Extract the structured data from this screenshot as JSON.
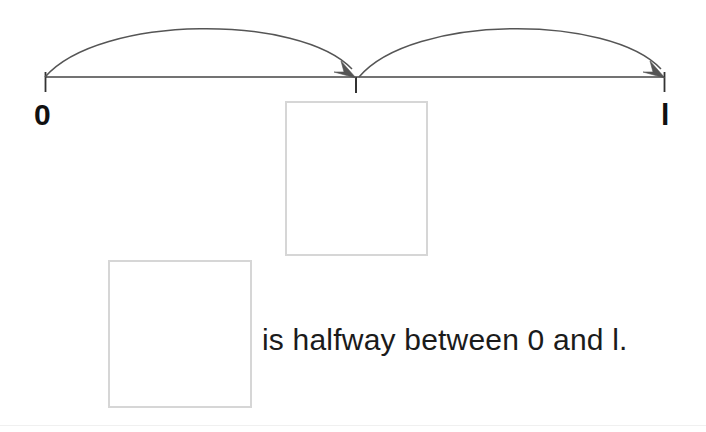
{
  "canvas": {
    "width": 706,
    "height": 432,
    "background": "#ffffff"
  },
  "diagram": {
    "type": "number-line-with-hop-arcs",
    "line": {
      "color": "#444444",
      "stroke_width": 1.6,
      "start_x": 45,
      "end_x": 665,
      "y": 77
    },
    "ticks": [
      {
        "name": "tick-zero",
        "x": 45,
        "label": "0",
        "top_y": 77,
        "bottom_y": 92
      },
      {
        "name": "tick-midpoint",
        "x": 356,
        "label": "",
        "top_y": 77,
        "bottom_y": 93
      },
      {
        "name": "tick-one",
        "x": 665,
        "label": "1",
        "top_y": 77,
        "bottom_y": 92
      }
    ],
    "arcs": [
      {
        "name": "hop-arc-left",
        "from_x": 45,
        "to_x": 356,
        "peak_y": 29,
        "color": "#555555",
        "arrowhead_at": "end"
      },
      {
        "name": "hop-arc-right",
        "from_x": 358,
        "to_x": 665,
        "peak_y": 29,
        "color": "#555555",
        "arrowhead_at": "end"
      }
    ]
  },
  "labels": {
    "zero": "0",
    "one": "l"
  },
  "answer_boxes": [
    {
      "name": "answer-box-top",
      "value": "",
      "placeholder": "",
      "border_color": "#d6d6d6"
    },
    {
      "name": "answer-box-bottom",
      "value": "",
      "placeholder": "",
      "border_color": "#d6d6d6"
    }
  ],
  "sentence": {
    "text": "is halfway between 0 and l.",
    "color": "#1b1b1b"
  },
  "colors": {
    "line": "#444444",
    "arc": "#555555",
    "box_border": "#d6d6d6",
    "text": "#1b1b1b",
    "separator": "#f0f0f0"
  }
}
